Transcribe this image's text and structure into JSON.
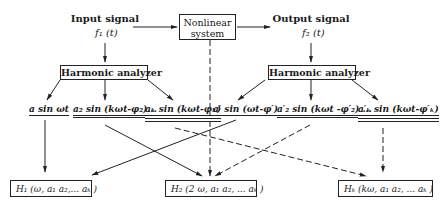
{
  "diagram": {
    "input": {
      "label": "Input signal",
      "signal": "f₁ (t)"
    },
    "system": {
      "line1": "Nonlinear",
      "line2": "system"
    },
    "output": {
      "label": "Output signal",
      "signal": "f₂ (t)"
    },
    "analyzer_left": {
      "label": "Harmonic analyzer"
    },
    "analyzer_right": {
      "label": "Harmonic analyzer"
    },
    "input_terms": [
      "a sin ωt",
      "a₂ sin (kωt-φ₂)...",
      "aₖ sin (kωt-φₖ)"
    ],
    "output_terms": [
      "a′ sin (ωt-φ′)",
      "a′₂ sin (kωt -φ′₂) ...",
      "a′ₖ sin (kωt-φ′ₖ)"
    ],
    "results": [
      "H₁ (ω, a₁ a₂,... aₖ )",
      "H₂ (2 ω, a₁ a₂, ... aₖ )",
      "Hₖ (kω, a₁ a₂, ... aₖ )"
    ]
  }
}
